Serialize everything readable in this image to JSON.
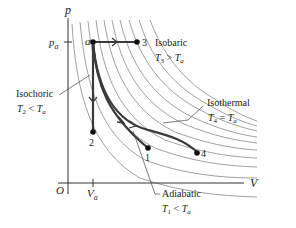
{
  "diagram": {
    "type": "pV-diagram",
    "axes": {
      "y_label": "p",
      "x_label": "V",
      "origin_label": "O",
      "y_tick_label": "p",
      "y_tick_sub": "a",
      "x_tick_label": "V",
      "x_tick_sub": "a"
    },
    "points": {
      "a": "a",
      "p1": "1",
      "p2": "2",
      "p3": "3",
      "p4": "4"
    },
    "annotations": {
      "isobaric": {
        "title": "Isobaric",
        "T": "T",
        "sub": "3",
        "rel": " > ",
        "Ta": "T",
        "Ta_sub": "a"
      },
      "isochoric": {
        "title": "Isochoric",
        "T": "T",
        "sub": "2",
        "rel": " < ",
        "Ta": "T",
        "Ta_sub": "a"
      },
      "isothermal": {
        "title": "Isothermal",
        "T": "T",
        "sub": "4",
        "rel": " = ",
        "Ta": "T",
        "Ta_sub": "a"
      },
      "adiabatic": {
        "title": "Adiabatic",
        "T": "T",
        "sub": "1",
        "rel": " < ",
        "Ta": "T",
        "Ta_sub": "a"
      }
    },
    "colors": {
      "path": "#3a3a3a",
      "isotherm": "#777777",
      "axis": "#333333"
    }
  }
}
